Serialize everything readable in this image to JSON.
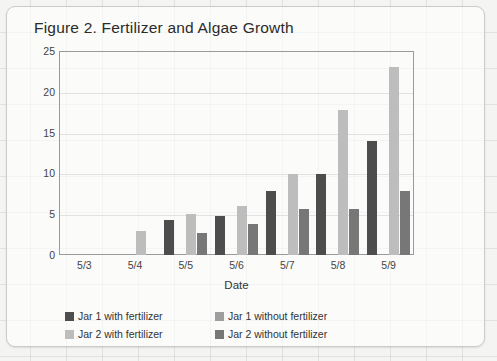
{
  "chart_data": {
    "type": "bar",
    "title": "Figure 2. Fertilizer and Algae Growth",
    "xlabel": "Date",
    "ylabel": "Diameter of algae (mm)",
    "ylim": [
      0,
      25
    ],
    "yticks": [
      0,
      5,
      10,
      15,
      20,
      25
    ],
    "grid": true,
    "legend_position": "bottom-left",
    "categories": [
      "5/3",
      "5/4",
      "5/5",
      "5/6",
      "5/7",
      "5/8",
      "5/9"
    ],
    "series": [
      {
        "name": "Jar 1 with fertilizer",
        "color": "#4d4d4d",
        "values": [
          0,
          0,
          4.3,
          4.8,
          7.9,
          9.9,
          14.0
        ]
      },
      {
        "name": "Jar 1 without fertilizer",
        "color": "#9e9e9e",
        "values": [
          0,
          0,
          0,
          0,
          0,
          0,
          0
        ]
      },
      {
        "name": "Jar 2 with fertilizer",
        "color": "#bdbdbd",
        "values": [
          0,
          3.0,
          5.0,
          6.0,
          9.9,
          17.8,
          23.0
        ]
      },
      {
        "name": "Jar 2 without fertilizer",
        "color": "#777777",
        "values": [
          0,
          0,
          2.7,
          3.8,
          5.7,
          5.7,
          7.9
        ]
      }
    ]
  },
  "legend": {
    "items": [
      {
        "label": "Jar 1 with fertilizer",
        "color": "#4d4d4d"
      },
      {
        "label": "Jar 1 without fertilizer",
        "color": "#9e9e9e"
      },
      {
        "label": "Jar 2 with fertilizer",
        "color": "#bdbdbd"
      },
      {
        "label": "Jar 2 without fertilizer",
        "color": "#777777"
      }
    ]
  }
}
